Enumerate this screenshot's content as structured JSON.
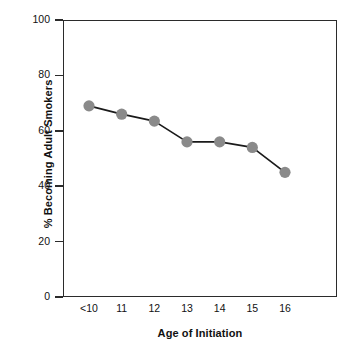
{
  "chart_data": {
    "type": "line",
    "title": "",
    "xlabel": "Age of Initiation",
    "ylabel": "% Becoming Adult Smokers",
    "categories": [
      "<10",
      "11",
      "12",
      "13",
      "14",
      "15",
      "16"
    ],
    "values": [
      69,
      66,
      63.5,
      56,
      56,
      54,
      45
    ],
    "series": [
      {
        "name": "% Becoming Adult Smokers",
        "values": [
          69,
          66,
          63.5,
          56,
          56,
          54,
          45
        ]
      }
    ],
    "ylim": [
      0,
      100
    ],
    "yticks": [
      0,
      20,
      40,
      60,
      80,
      100
    ],
    "ytick_labels": [
      "0",
      "20",
      "40",
      "60",
      "80",
      "100"
    ],
    "xtick_labels": [
      "<10",
      "11",
      "12",
      "13",
      "14",
      "15",
      "16"
    ],
    "grid": false,
    "legend": false,
    "legend_position": "none",
    "marker": "circle",
    "marker_color": "#8a8a8a",
    "line_color": "#1a1a1a",
    "axis_color": "#2b2b2b",
    "background_color": "#ffffff"
  }
}
